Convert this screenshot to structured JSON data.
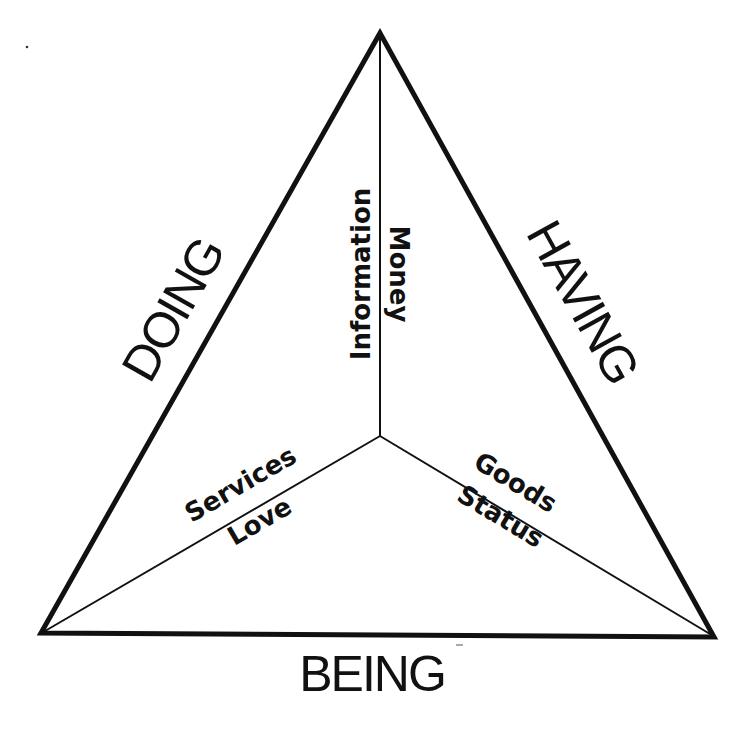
{
  "diagram": {
    "type": "triangle-with-center-spokes",
    "outer_labels": {
      "left_side": "DOING",
      "right_side": "HAVING",
      "bottom_side": "BEING"
    },
    "spokes": {
      "vertical": {
        "left": "Information",
        "right": "Money"
      },
      "lower_left": {
        "above": "Services",
        "below": "Love"
      },
      "lower_right": {
        "above": "Goods",
        "below": "Status"
      }
    },
    "colors": {
      "line": "#111111",
      "background": "#ffffff",
      "text": "#111111"
    }
  }
}
